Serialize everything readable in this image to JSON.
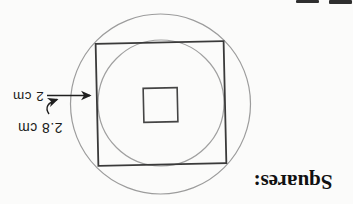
{
  "heading": {
    "text": "Squares:"
  },
  "diagram": {
    "label_straight_arrow": "2 cm",
    "label_curved_arrow": "2.8 cm",
    "shapes": [
      "outer-circle",
      "outer-square",
      "inscribed-circle",
      "center-square"
    ]
  },
  "colors": {
    "background": "#fbfbfa",
    "square_line": "#3a3a3a",
    "circle_line": "#9c9c9c",
    "ink": "#1b1b1b"
  }
}
